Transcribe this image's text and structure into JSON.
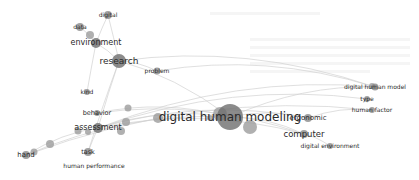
{
  "network": {
    "type": "keyword co-occurrence map",
    "colors": {
      "node": "#8a8a8a",
      "edge": "#cfcfcf",
      "label": "#2a2a2a",
      "background": "#ffffff"
    },
    "nodes": [
      {
        "id": "digital",
        "label": "digital",
        "x": 108,
        "y": 15,
        "r": 4,
        "fs": 6
      },
      {
        "id": "data",
        "label": "data",
        "x": 80,
        "y": 27,
        "r": 4,
        "fs": 6
      },
      {
        "id": "environment",
        "label": "environment",
        "x": 96,
        "y": 43,
        "r": 5,
        "fs": 8
      },
      {
        "id": "research",
        "label": "research",
        "x": 119,
        "y": 61,
        "r": 7,
        "fs": 9
      },
      {
        "id": "problem",
        "label": "problem",
        "x": 157,
        "y": 71,
        "r": 3.5,
        "fs": 6
      },
      {
        "id": "kind",
        "label": "kind",
        "x": 87,
        "y": 92,
        "r": 3,
        "fs": 6
      },
      {
        "id": "behavior",
        "label": "behavior",
        "x": 97,
        "y": 113,
        "r": 3,
        "fs": 6.5
      },
      {
        "id": "assessment",
        "label": "assessment",
        "x": 98,
        "y": 128,
        "r": 5,
        "fs": 8
      },
      {
        "id": "hand",
        "label": "hand",
        "x": 26,
        "y": 155,
        "r": 4,
        "fs": 7
      },
      {
        "id": "task",
        "label": "task",
        "x": 88,
        "y": 152,
        "r": 4,
        "fs": 6.5
      },
      {
        "id": "human performance",
        "label": "human performance",
        "x": 94,
        "y": 166,
        "r": 0,
        "fs": 6
      },
      {
        "id": "digital human modeling",
        "label": "digital human modeling",
        "x": 230,
        "y": 117,
        "r": 13,
        "fs": 12
      },
      {
        "id": "ergonomic",
        "label": "ergonomic",
        "x": 308,
        "y": 118,
        "r": 4,
        "fs": 7
      },
      {
        "id": "computer",
        "label": "computer",
        "x": 304,
        "y": 134,
        "r": 4,
        "fs": 8.5
      },
      {
        "id": "digital environment",
        "label": "digital environment",
        "x": 330,
        "y": 146,
        "r": 3,
        "fs": 6
      },
      {
        "id": "digital human model",
        "label": "digital human model",
        "x": 375,
        "y": 87,
        "r": 3.5,
        "fs": 6
      },
      {
        "id": "type",
        "label": "type",
        "x": 367,
        "y": 99,
        "r": 3,
        "fs": 6
      },
      {
        "id": "human factor",
        "label": "human factor",
        "x": 372,
        "y": 110,
        "r": 3,
        "fs": 6
      }
    ],
    "unlabeled_nodes": [
      {
        "x": 90,
        "y": 35,
        "r": 4
      },
      {
        "x": 128,
        "y": 108,
        "r": 3.5
      },
      {
        "x": 126,
        "y": 122,
        "r": 4
      },
      {
        "x": 121,
        "y": 131,
        "r": 4
      },
      {
        "x": 78,
        "y": 131,
        "r": 3.5
      },
      {
        "x": 50,
        "y": 144,
        "r": 4
      },
      {
        "x": 34,
        "y": 152,
        "r": 3.5
      },
      {
        "x": 88,
        "y": 132,
        "r": 3
      },
      {
        "x": 158,
        "y": 118,
        "r": 5
      },
      {
        "x": 220,
        "y": 114,
        "r": 7
      },
      {
        "x": 250,
        "y": 127,
        "r": 7
      },
      {
        "x": 210,
        "y": 118,
        "r": 3
      },
      {
        "x": 372,
        "y": 86,
        "r": 3
      }
    ]
  }
}
